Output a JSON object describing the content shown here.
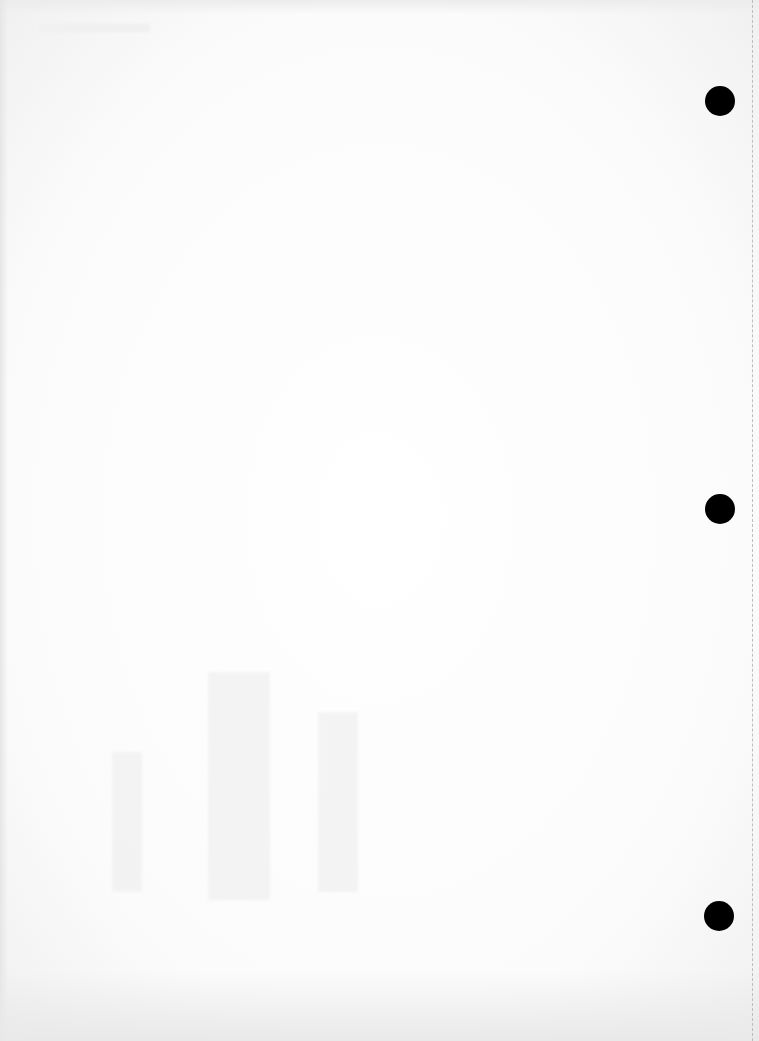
{
  "page": {
    "type": "blank scanned sheet",
    "text_content": [],
    "background_color": "#ffffff"
  },
  "punch_holes": [
    {
      "cx": 720,
      "cy": 101,
      "r": 15,
      "color": "#000000"
    },
    {
      "cx": 720,
      "cy": 509,
      "r": 15,
      "color": "#000000"
    },
    {
      "cx": 719,
      "cy": 916,
      "r": 15,
      "color": "#000000"
    }
  ],
  "perforation_line": {
    "side": "right",
    "style": "dashed",
    "color": "#bdbdbd"
  },
  "bleed_through_patches": [
    {
      "x": 112,
      "y": 752,
      "w": 30,
      "h": 140
    },
    {
      "x": 208,
      "y": 672,
      "w": 62,
      "h": 228
    },
    {
      "x": 318,
      "y": 712,
      "w": 40,
      "h": 180
    }
  ]
}
